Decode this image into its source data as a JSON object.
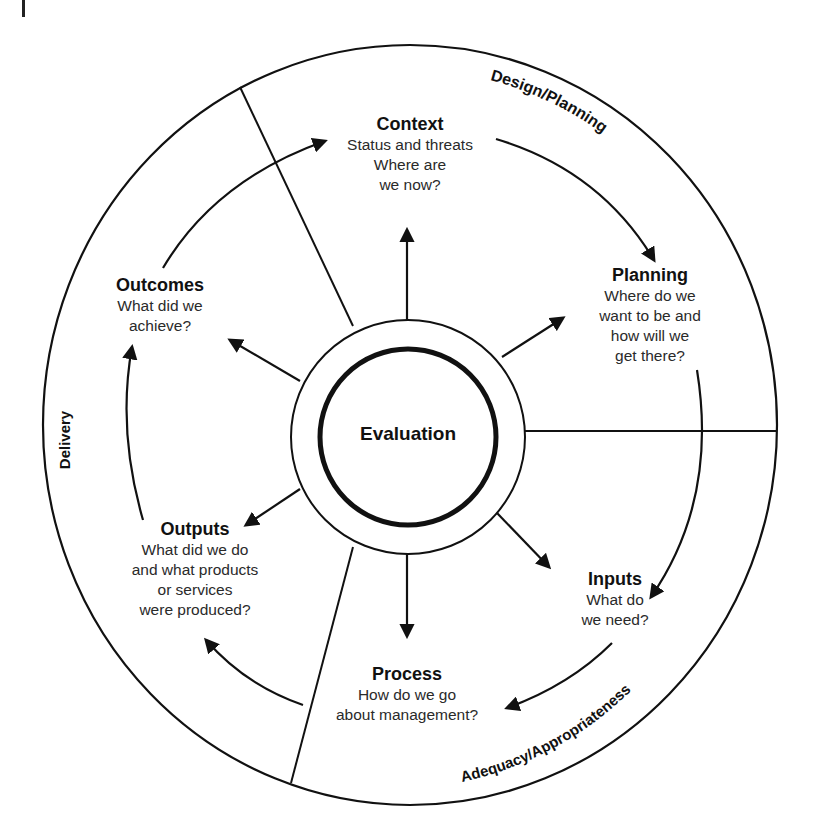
{
  "diagram": {
    "center": {
      "label": "Evaluation"
    },
    "stages": {
      "design_planning": "Design/Planning",
      "adequacy": "Adequacy/Appropriateness",
      "delivery": "Delivery"
    },
    "nodes": {
      "context": {
        "title": "Context",
        "lines": [
          "Status and threats",
          "Where are",
          "we now?"
        ]
      },
      "planning": {
        "title": "Planning",
        "lines": [
          "Where do we",
          "want to be and",
          "how will we",
          "get there?"
        ]
      },
      "inputs": {
        "title": "Inputs",
        "lines": [
          "What do",
          "we need?"
        ]
      },
      "process": {
        "title": "Process",
        "lines": [
          "How do we go",
          "about management?"
        ]
      },
      "outputs": {
        "title": "Outputs",
        "lines": [
          "What did we do",
          "and what products",
          "or services",
          "were produced?"
        ]
      },
      "outcomes": {
        "title": "Outcomes",
        "lines": [
          "What did we",
          "achieve?"
        ]
      }
    },
    "cycle_order": [
      "Context",
      "Planning",
      "Inputs",
      "Process",
      "Outputs",
      "Outcomes"
    ],
    "colors": {
      "stroke": "#111111",
      "background": "#ffffff"
    }
  }
}
